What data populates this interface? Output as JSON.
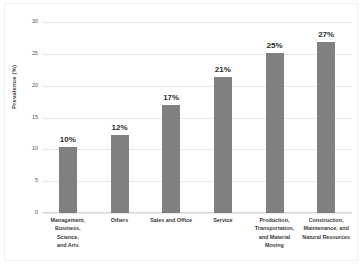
{
  "chart_data": {
    "type": "bar",
    "title": "",
    "xlabel": "",
    "ylabel": "Prevalence (%)",
    "ylim": [
      0,
      30
    ],
    "yticks": [
      0,
      5,
      10,
      15,
      20,
      25,
      30
    ],
    "ytick_labels": [
      "0",
      "5",
      "10",
      "15",
      "20",
      "25",
      "30"
    ],
    "grid": true,
    "legend": "none",
    "categories": [
      "Management, Business, Science, and Arts",
      "Others",
      "Sales and Office",
      "Service",
      "Production, Transportation, and Material Moving",
      "Construction, Maintenance, and Natural Resources"
    ],
    "category_lines": [
      [
        "Management,",
        "Business, Science,",
        "and Arts"
      ],
      [
        "Others"
      ],
      [
        "Sales and Office"
      ],
      [
        "Service"
      ],
      [
        "Production,",
        "Transportation,",
        "and Material",
        "Moving"
      ],
      [
        "Construction,",
        "Maintenance, and",
        "Natural Resources"
      ]
    ],
    "values": [
      10.3,
      12.2,
      17.0,
      21.4,
      25.1,
      26.9
    ],
    "data_labels": [
      "10%",
      "12%",
      "17%",
      "21%",
      "25%",
      "27%"
    ],
    "bar_color": "#808080",
    "gridline_color": "#e8e8e8",
    "axis_color": "#d6d6d6",
    "background": "#ffffff",
    "label_color": "#2b2b2b"
  }
}
